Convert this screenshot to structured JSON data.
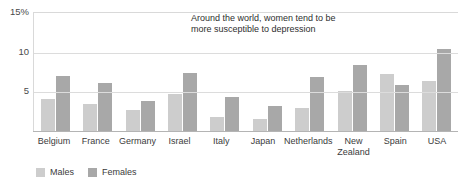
{
  "chart_data": {
    "type": "bar",
    "title": "",
    "subtitle": "",
    "xlabel": "",
    "ylabel": "",
    "ylim": [
      0,
      15
    ],
    "yticks": [
      "15%",
      "10",
      "5"
    ],
    "ytick_values": [
      15,
      10,
      5
    ],
    "grid": true,
    "grid_axis": "y",
    "legend_position": "bottom-left",
    "annotation": "Around the world, women tend to be more susceptible to depression",
    "categories": [
      "Belgium",
      "France",
      "Germany",
      "Israel",
      "Italy",
      "Japan",
      "Netherlands",
      "New Zealand",
      "Spain",
      "USA"
    ],
    "series": [
      {
        "name": "Males",
        "color": "#cdcdcd",
        "values": [
          4.0,
          3.4,
          2.6,
          4.7,
          1.8,
          1.5,
          2.9,
          5.1,
          7.2,
          6.3
        ]
      },
      {
        "name": "Females",
        "color": "#a8a8a8",
        "values": [
          6.9,
          6.1,
          3.8,
          7.3,
          4.3,
          3.1,
          6.8,
          8.3,
          5.8,
          10.3
        ]
      }
    ]
  },
  "colors": {
    "males": "#cdcdcd",
    "females": "#a8a8a8",
    "gridline": "#dcdcdc",
    "axis": "#b4b4b4",
    "text": "#3b3b3b"
  }
}
